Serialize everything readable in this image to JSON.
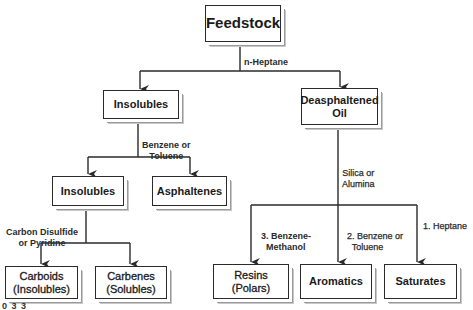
{
  "diagram": {
    "type": "flowchart",
    "nodes": {
      "feedstock": "Feedstock",
      "insolubles_1": "Insolubles",
      "deasphaltened_oil": "Deasphaltened\nOil",
      "insolubles_2": "Insolubles",
      "asphaltenes": "Asphaltenes",
      "carboids": "Carboids\n(Insolubles)",
      "carbenes": "Carbenes\n(Solubles)",
      "resins": "Resins\n(Polars)",
      "aromatics": "Aromatics",
      "saturates": "Saturates"
    },
    "edge_labels": {
      "n_heptane": "n-Heptane",
      "benzene_or_toluene_1": "Benzene or\nToluene",
      "carbon_disulfide": "Carbon Disulfide\nor Pyridine",
      "silica_or_alumina": "Silica or\nAlumina",
      "benzene_methanol": "3. Benzene-\n    Methanol",
      "benzene_or_toluene_2": "2. Benzene or\n    Toluene",
      "heptane": "1. Heptane"
    },
    "edges": [
      {
        "from": "feedstock",
        "to": "insolubles_1",
        "label": "n_heptane"
      },
      {
        "from": "feedstock",
        "to": "deasphaltened_oil",
        "label": "n_heptane"
      },
      {
        "from": "insolubles_1",
        "to": "insolubles_2",
        "label": "benzene_or_toluene_1"
      },
      {
        "from": "insolubles_1",
        "to": "asphaltenes",
        "label": "benzene_or_toluene_1"
      },
      {
        "from": "insolubles_2",
        "to": "carboids",
        "label": "carbon_disulfide"
      },
      {
        "from": "insolubles_2",
        "to": "carbenes",
        "label": "carbon_disulfide"
      },
      {
        "from": "deasphaltened_oil",
        "to": "resins",
        "label": "benzene_methanol"
      },
      {
        "from": "deasphaltened_oil",
        "to": "aromatics",
        "label": "benzene_or_toluene_2"
      },
      {
        "from": "deasphaltened_oil",
        "to": "saturates",
        "label": "heptane"
      }
    ],
    "footnote": "0 3 3"
  }
}
